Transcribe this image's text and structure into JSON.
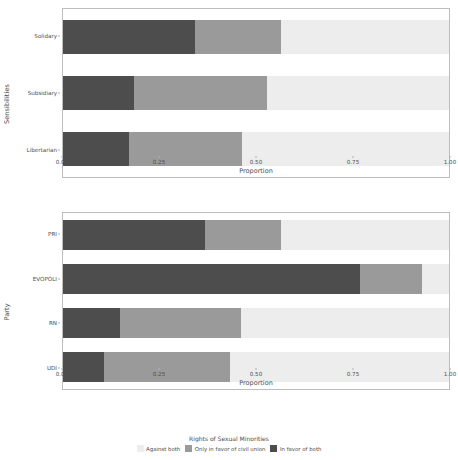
{
  "figure": {
    "background": "#ffffff",
    "axis_color": "#bdbdbd",
    "text_color": "#4d4d4d"
  },
  "legend": {
    "title": "Rights of Sexual Minorities",
    "items": [
      {
        "label": "Against both",
        "color": "#ededed"
      },
      {
        "label": "Only in favor of civil union",
        "color": "#9a9a9a"
      },
      {
        "label": "In favor of both",
        "color": "#4d4d4d"
      }
    ]
  },
  "chart_data": [
    {
      "type": "bar",
      "orientation": "horizontal",
      "stacked": true,
      "title": "",
      "xlabel": "Proportion",
      "ylabel": "Sensibilities",
      "xlim": [
        0.0,
        1.0
      ],
      "xticks": [
        0.0,
        0.25,
        0.5,
        0.75,
        1.0
      ],
      "xticklabels": [
        "0.00",
        "0.25",
        "0.50",
        "0.75",
        "1.00"
      ],
      "grid": false,
      "legend_position": "bottom",
      "categories": [
        "Solidary",
        "Subsidiary",
        "Libertarian"
      ],
      "series": [
        {
          "name": "In favor of both",
          "color": "#4d4d4d",
          "values": [
            0.341,
            0.184,
            0.172
          ]
        },
        {
          "name": "Only in favor of civil union",
          "color": "#9a9a9a",
          "values": [
            0.223,
            0.344,
            0.291
          ]
        },
        {
          "name": "Against both",
          "color": "#ededed",
          "values": [
            0.436,
            0.472,
            0.537
          ]
        }
      ]
    },
    {
      "type": "bar",
      "orientation": "horizontal",
      "stacked": true,
      "title": "",
      "xlabel": "Proportion",
      "ylabel": "Party",
      "xlim": [
        0.0,
        1.0
      ],
      "xticks": [
        0.0,
        0.25,
        0.5,
        0.75,
        1.0
      ],
      "xticklabels": [
        "0.00",
        "0.25",
        "0.50",
        "0.75",
        "1.00"
      ],
      "grid": false,
      "legend_position": "bottom",
      "categories": [
        "PRI",
        "EVOPOLI",
        "RN",
        "UDI"
      ],
      "series": [
        {
          "name": "In favor of both",
          "color": "#4d4d4d",
          "values": [
            0.367,
            0.769,
            0.147,
            0.105
          ]
        },
        {
          "name": "Only in favor of civil union",
          "color": "#9a9a9a",
          "values": [
            0.198,
            0.162,
            0.314,
            0.328
          ]
        },
        {
          "name": "Against both",
          "color": "#ededed",
          "values": [
            0.435,
            0.069,
            0.539,
            0.567
          ]
        }
      ]
    }
  ]
}
